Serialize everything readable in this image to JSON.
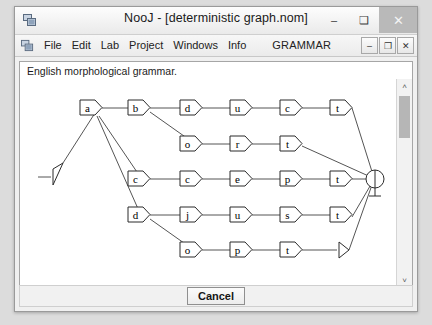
{
  "window": {
    "title": "NooJ - [deterministic graph.nom]",
    "app_icon": "app-window-icon",
    "buttons": {
      "minimize": "–",
      "maximize": "❑",
      "close": "✕"
    }
  },
  "menubar": {
    "icon": "app-window-icon",
    "items": [
      "File",
      "Edit",
      "Lab",
      "Project",
      "Windows",
      "Info"
    ],
    "mode_label": "GRAMMAR",
    "mdi_buttons": {
      "minimize": "–",
      "restore": "❐",
      "close": "✕"
    }
  },
  "document": {
    "caption": "English  morphological grammar.",
    "scrollbars": {
      "vertical": {
        "up": "˄",
        "down": "˅"
      },
      "horizontal": {
        "left": "‹",
        "right": "›"
      }
    }
  },
  "bottom": {
    "cancel_label": "Cancel"
  },
  "graph": {
    "start_marker": "start-arrow",
    "end_marker": "final-state-circle",
    "nodes": [
      {
        "id": "n_a",
        "label": "a",
        "x": 88,
        "y": 104
      },
      {
        "id": "n_b",
        "label": "b",
        "x": 136,
        "y": 104
      },
      {
        "id": "n_d1",
        "label": "d",
        "x": 188,
        "y": 104
      },
      {
        "id": "n_u1",
        "label": "u",
        "x": 238,
        "y": 104
      },
      {
        "id": "n_c1",
        "label": "c",
        "x": 288,
        "y": 104
      },
      {
        "id": "n_t1",
        "label": "t",
        "x": 338,
        "y": 104
      },
      {
        "id": "n_o1",
        "label": "o",
        "x": 188,
        "y": 140
      },
      {
        "id": "n_r",
        "label": "r",
        "x": 238,
        "y": 140
      },
      {
        "id": "n_t2",
        "label": "t",
        "x": 288,
        "y": 140
      },
      {
        "id": "n_c2",
        "label": "c",
        "x": 136,
        "y": 175
      },
      {
        "id": "n_c3",
        "label": "c",
        "x": 188,
        "y": 175
      },
      {
        "id": "n_e",
        "label": "e",
        "x": 238,
        "y": 175
      },
      {
        "id": "n_p1",
        "label": "p",
        "x": 288,
        "y": 175
      },
      {
        "id": "n_t3",
        "label": "t",
        "x": 338,
        "y": 175
      },
      {
        "id": "n_d2",
        "label": "d",
        "x": 136,
        "y": 211
      },
      {
        "id": "n_j",
        "label": "j",
        "x": 188,
        "y": 211
      },
      {
        "id": "n_u2",
        "label": "u",
        "x": 238,
        "y": 211
      },
      {
        "id": "n_s",
        "label": "s",
        "x": 288,
        "y": 211
      },
      {
        "id": "n_t4",
        "label": "t",
        "x": 338,
        "y": 211
      },
      {
        "id": "n_o2",
        "label": "o",
        "x": 188,
        "y": 246
      },
      {
        "id": "n_p2",
        "label": "p",
        "x": 238,
        "y": 246
      },
      {
        "id": "n_t5",
        "label": "t",
        "x": 288,
        "y": 246
      }
    ],
    "paths": [
      "a-b-d-u-c-t",
      "a-b-o-r-t",
      "a-c-c-e-p-t",
      "a-d-j-u-s-t",
      "a-d-o-p-t"
    ]
  }
}
